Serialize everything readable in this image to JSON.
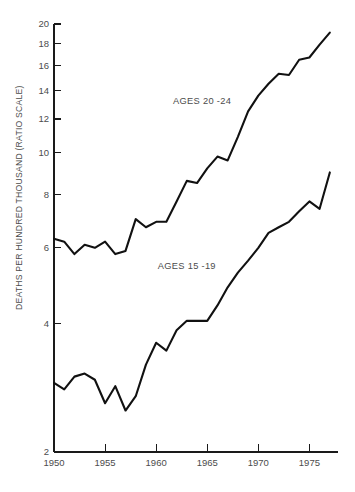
{
  "chart_data": {
    "type": "line",
    "title": "",
    "subtitle": "",
    "xlabel": "",
    "ylabel": "DEATHS PER HUNDRED THOUSAND (RATIO SCALE)",
    "yscale": "log",
    "xscale": "linear",
    "grid": false,
    "legend_position": "inline-annotation",
    "xlim": [
      1950,
      1977.8
    ],
    "ylim": [
      2,
      20
    ],
    "xticks": [
      1950,
      1955,
      1960,
      1965,
      1970,
      1975
    ],
    "xticklabels": [
      "1950",
      "1955",
      "1960",
      "1965",
      "1970",
      "1975"
    ],
    "yticks": [
      2,
      4,
      6,
      8,
      10,
      12,
      14,
      16,
      18,
      20
    ],
    "yticklabels": [
      "2",
      "4",
      "6",
      "8",
      "10",
      "12",
      "14",
      "16",
      "18",
      "20"
    ],
    "x": [
      1950,
      1951,
      1952,
      1953,
      1954,
      1955,
      1956,
      1957,
      1958,
      1959,
      1960,
      1961,
      1962,
      1963,
      1964,
      1965,
      1966,
      1967,
      1968,
      1969,
      1970,
      1971,
      1972,
      1973,
      1974,
      1975,
      1976,
      1977
    ],
    "series": [
      {
        "name": "AGES 20 -24",
        "label": "AGES 20 -24",
        "color": "#111111",
        "label_x": 1964.5,
        "label_y": 13.0,
        "values": [
          6.3,
          6.2,
          5.8,
          6.1,
          6.0,
          6.2,
          5.8,
          5.9,
          7.0,
          6.7,
          6.9,
          6.9,
          7.7,
          8.6,
          8.5,
          9.2,
          9.8,
          9.6,
          10.9,
          12.5,
          13.6,
          14.5,
          15.3,
          15.2,
          16.5,
          16.7,
          17.9,
          19.1
        ]
      },
      {
        "name": "AGES 15 -19",
        "label": "AGES 15 -19",
        "color": "#111111",
        "label_x": 1963.0,
        "label_y": 5.35,
        "values": [
          2.9,
          2.8,
          3.0,
          3.05,
          2.95,
          2.6,
          2.85,
          2.5,
          2.7,
          3.2,
          3.6,
          3.45,
          3.85,
          4.05,
          4.05,
          4.05,
          4.4,
          4.85,
          5.25,
          5.6,
          6.0,
          6.5,
          6.7,
          6.9,
          7.3,
          7.7,
          7.4,
          9.0
        ]
      }
    ],
    "annotations": []
  },
  "axis": {
    "y_title": "DEATHS PER HUNDRED THOUSAND (RATIO SCALE)"
  }
}
